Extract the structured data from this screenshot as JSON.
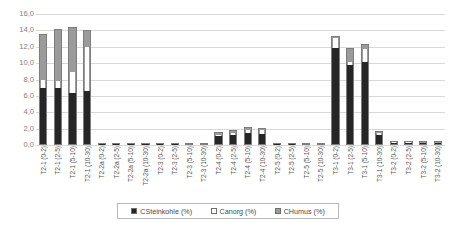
{
  "chart_data": {
    "type": "bar",
    "subtype": "stacked",
    "title": "",
    "xlabel": "",
    "ylabel": "",
    "ylim": [
      0,
      16
    ],
    "ytick_step": 2,
    "grid": true,
    "legend_position": "bottom",
    "ytick_labels": [
      "16,0",
      "14,0",
      "12,0",
      "10,0",
      "8,0",
      "6,0",
      "4,0",
      "2,0",
      "0,0"
    ],
    "ytick_values": [
      16,
      14,
      12,
      10,
      8,
      6,
      4,
      2,
      0
    ],
    "categories": [
      "T2-1 (0-2)",
      "T2-1 (2-5)",
      "T2-1 (5-10)",
      "T2-1 (10-30)",
      "T2-2a (0-2)",
      "T2-2a (2-5)",
      "T2-2a (5-10)",
      "T2-2a (10-30)",
      "T2-3 (0-2)",
      "T2-3 (2-5)",
      "T2-3 (5-10)",
      "T2-3 (10-30)",
      "T2-4 (0-2)",
      "T2-4 (2-5)",
      "T2-4 (5-10)",
      "T2-4 (10-30)",
      "T2-5 (0-2)",
      "T2-5 (2-5)",
      "T2-5 (5-10)",
      "T2-5 (10-30)",
      "T3-1 (0-2)",
      "T3-1 (2-5)",
      "T3-1 (5-10)",
      "T3-1 (10-30)",
      "T3-2 (0-2)",
      "T3-2 (2-5)",
      "T3-2 (5-10)",
      "T3-2 (10-30)"
    ],
    "series": [
      {
        "name": "CSteinkohle (%)",
        "color": "#262626",
        "values": [
          7.0,
          6.9,
          6.4,
          6.6,
          0.1,
          0.1,
          0.1,
          0.1,
          0.1,
          0.1,
          0.1,
          0.1,
          1.1,
          1.3,
          1.5,
          1.4,
          0.1,
          0.1,
          0.1,
          0.1,
          12.0,
          9.8,
          10.2,
          1.3,
          0.3,
          0.3,
          0.25,
          0.25
        ]
      },
      {
        "name": "Canorg (%)",
        "color": "#ffffff",
        "values": [
          1.0,
          0.9,
          2.5,
          5.4,
          0.05,
          0.05,
          0.05,
          0.05,
          0.05,
          0.05,
          0.05,
          0.05,
          0.15,
          0.2,
          0.4,
          0.5,
          0.05,
          0.05,
          0.05,
          0.05,
          1.2,
          0.4,
          1.6,
          0.25,
          0.1,
          0.1,
          0.08,
          0.08
        ]
      },
      {
        "name": "CHumus (%)",
        "color": "#9b9b9b",
        "values": [
          5.5,
          6.4,
          5.5,
          2.0,
          0.15,
          0.15,
          0.12,
          0.12,
          0.15,
          0.12,
          0.1,
          0.1,
          0.35,
          0.3,
          0.25,
          0.2,
          0.12,
          0.12,
          0.1,
          0.1,
          0.1,
          1.6,
          0.5,
          0.2,
          0.15,
          0.15,
          0.12,
          0.12
        ]
      }
    ]
  },
  "legend": {
    "items": [
      {
        "label": "CSteinkohle (%)",
        "swatch": "dark-square-swatch"
      },
      {
        "label": "Canorg (%)",
        "swatch": "white-square-swatch"
      },
      {
        "label": "CHumus (%)",
        "swatch": "gray-square-swatch"
      }
    ]
  }
}
